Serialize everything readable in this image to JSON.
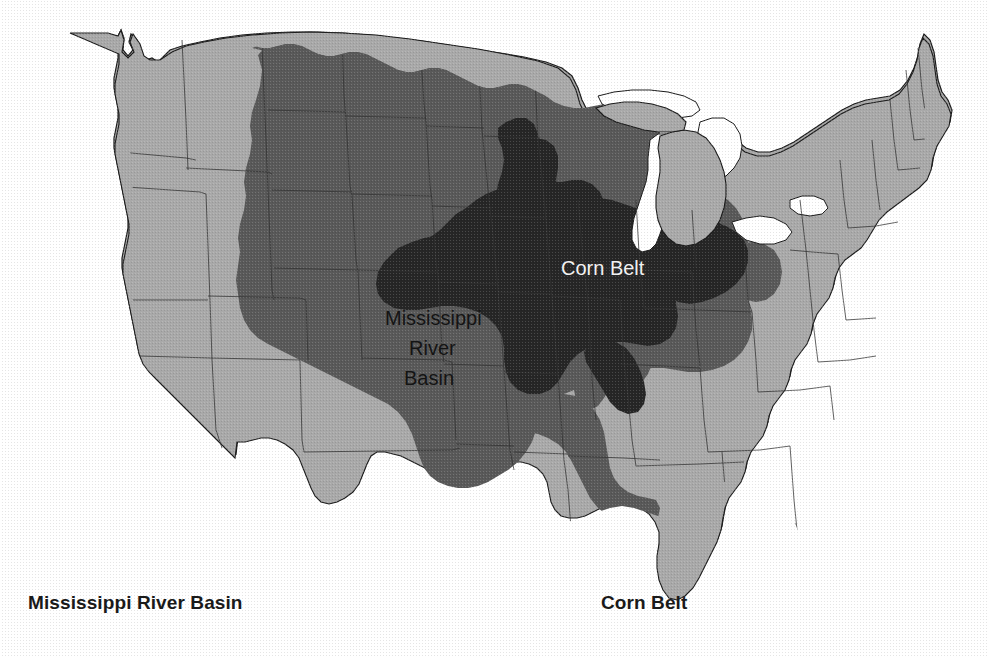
{
  "figure": {
    "kind": "thematic-map"
  },
  "map": {
    "in_map_labels": {
      "basin": {
        "line1": "Mississippi",
        "line2": "River",
        "line3": "Basin"
      },
      "corn_belt": "Corn Belt"
    },
    "regions": [
      {
        "id": "base-states",
        "name": "United States (other states)",
        "fill": "#a9a9a9"
      },
      {
        "id": "mississippi-river-basin",
        "name": "Mississippi River Basin",
        "fill": "#595959"
      },
      {
        "id": "corn-belt",
        "name": "Corn Belt",
        "fill": "#262626"
      },
      {
        "id": "great-lakes",
        "name": "Great Lakes",
        "fill": "#ffffff"
      }
    ],
    "colors": {
      "background": "#ffffff",
      "base_states": "#a9a9a9",
      "basin": "#595959",
      "corn_belt": "#262626",
      "outline": "#1c1c1c",
      "state_border": "#3a3a3a",
      "label_dark": "#141414",
      "label_light": "#f2f2f2"
    }
  },
  "legend": {
    "basin_label": "Mississippi River Basin",
    "corn_belt_label": "Corn Belt"
  }
}
